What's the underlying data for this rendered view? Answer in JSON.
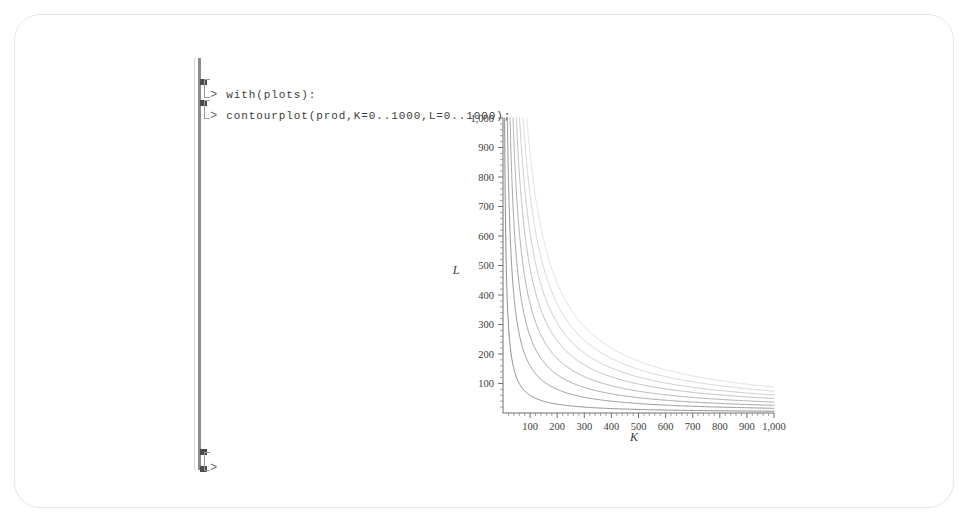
{
  "worksheet": {
    "prompt_symbol": ">",
    "lines": [
      {
        "id": "line-1",
        "code": "with(plots):"
      },
      {
        "id": "line-2",
        "code": "contourplot(prod,K=0..1000,L=0..1000);"
      },
      {
        "id": "line-3",
        "code": ""
      }
    ]
  },
  "colors": {
    "frame_border": "#e7e7e7",
    "group_bar": "#8d8d8d",
    "prompt": "#6b6b6b",
    "code_text": "#3c3c3c",
    "axis": "#6f6f6f",
    "contour_dark": "#8a8a8a",
    "contour_light": "#d9d9d9",
    "background": "#ffffff"
  },
  "chart_data": {
    "type": "line",
    "title": "",
    "subtitle": "",
    "xlabel": "K",
    "ylabel": "L",
    "xlim": [
      0,
      1000
    ],
    "ylim": [
      0,
      1000
    ],
    "grid": false,
    "legend": "none",
    "x_ticks": [
      100,
      200,
      300,
      400,
      500,
      600,
      700,
      800,
      900,
      1000
    ],
    "x_tick_labels": [
      "100",
      "200",
      "300",
      "400",
      "500",
      "600",
      "700",
      "800",
      "900",
      "1,000"
    ],
    "y_ticks": [
      100,
      200,
      300,
      400,
      500,
      600,
      700,
      800,
      900,
      1000
    ],
    "y_tick_labels": [
      "100",
      "200",
      "300",
      "400",
      "500",
      "600",
      "700",
      "800",
      "900",
      "1,000"
    ],
    "minor_ticks_per_interval": 4,
    "contour_form": "L = c / K",
    "series": [
      {
        "name": "level-1",
        "constant": 6000,
        "shade": "#7e7e7e",
        "right_edge_L": 60,
        "x_at_L1000": 9
      },
      {
        "name": "level-2",
        "constant": 16000,
        "shade": "#8c8c8c",
        "right_edge_L": 152,
        "x_at_L1000": 17
      },
      {
        "name": "level-3",
        "constant": 26000,
        "shade": "#9a9a9a",
        "right_edge_L": 255,
        "x_at_L1000": 27
      },
      {
        "name": "level-4",
        "constant": 37000,
        "shade": "#a8a8a8",
        "right_edge_L": 360,
        "x_at_L1000": 38
      },
      {
        "name": "level-5",
        "constant": 49000,
        "shade": "#b8b8b8",
        "right_edge_L": 480,
        "x_at_L1000": 50
      },
      {
        "name": "level-6",
        "constant": 61000,
        "shade": "#c6c6c6",
        "right_edge_L": 605,
        "x_at_L1000": 62
      },
      {
        "name": "level-7",
        "constant": 74000,
        "shade": "#d2d2d2",
        "right_edge_L": 735,
        "x_at_L1000": 76
      },
      {
        "name": "level-8",
        "constant": 88000,
        "shade": "#dedede",
        "right_edge_L": 875,
        "x_at_L1000": 90
      }
    ]
  }
}
